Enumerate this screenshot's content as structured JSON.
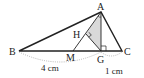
{
  "diagram": {
    "points": {
      "A": {
        "label": "A",
        "x": 101,
        "y": 12
      },
      "B": {
        "label": "B",
        "x": 19,
        "y": 51
      },
      "C": {
        "label": "C",
        "x": 122,
        "y": 51
      },
      "G": {
        "label": "G",
        "x": 101,
        "y": 51
      },
      "M": {
        "label": "M",
        "x": 73,
        "y": 51
      },
      "H": {
        "label": "H",
        "x": 86,
        "y": 34
      }
    },
    "measurements": {
      "BG": "4 cm",
      "GC": "1 cm"
    },
    "shaded_region": "triangle AHG",
    "colors": {
      "line": "#222222",
      "shade": "#d9d9d9",
      "dotted": "#999999"
    }
  }
}
